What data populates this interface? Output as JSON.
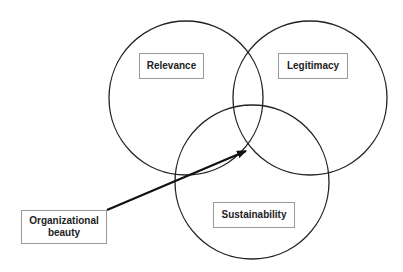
{
  "diagram": {
    "type": "venn",
    "circles": [
      {
        "label": "Relevance",
        "cx": 186,
        "cy": 98,
        "r": 77
      },
      {
        "label": "Legitimacy",
        "cx": 310,
        "cy": 98,
        "r": 77
      },
      {
        "label": "Sustainability",
        "cx": 252,
        "cy": 182,
        "r": 77
      }
    ],
    "callout": {
      "label": "Organizational beauty",
      "points_to": "intersection of all three circles"
    },
    "colors": {
      "stroke": "#222222",
      "box_border": "#9a9a9a",
      "text": "#222222"
    }
  }
}
